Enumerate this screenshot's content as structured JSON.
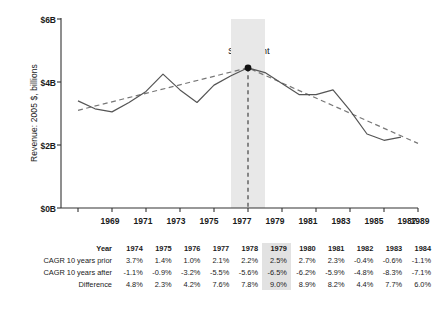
{
  "chart_data": {
    "type": "line",
    "title": "",
    "xlabel": "",
    "ylabel": "Revenue: 2005 $, billions",
    "xlim": [
      1968,
      1989
    ],
    "ylim": [
      0,
      6
    ],
    "xticks": [
      1969,
      1971,
      1973,
      1975,
      1977,
      1979,
      1981,
      1983,
      1985,
      1987,
      1989
    ],
    "xtick_labels": [
      "1969",
      "1971",
      "1973",
      "1975",
      "1977",
      "1979",
      "1981",
      "1983",
      "1985",
      "1987",
      "1989"
    ],
    "yticks": [
      0,
      2,
      4,
      6
    ],
    "ytick_labels": [
      "$0B",
      "$2B",
      "$4B",
      "$6B"
    ],
    "grid": false,
    "legend": null,
    "series": [
      {
        "name": "Revenue",
        "style": "solid",
        "color": "#555555",
        "x": [
          1969,
          1970,
          1971,
          1972,
          1973,
          1974,
          1975,
          1976,
          1977,
          1978,
          1979,
          1980,
          1981,
          1982,
          1983,
          1984,
          1985,
          1986,
          1987,
          1988
        ],
        "values": [
          3.4,
          3.15,
          3.05,
          3.35,
          3.7,
          4.25,
          3.75,
          3.35,
          3.9,
          4.2,
          4.45,
          4.3,
          3.95,
          3.6,
          3.6,
          3.75,
          3.1,
          2.35,
          2.15,
          2.25
        ]
      },
      {
        "name": "Trendline",
        "style": "dashed",
        "color": "#777777",
        "x": [
          1969,
          1979,
          1989
        ],
        "values": [
          3.1,
          4.45,
          2.05
        ]
      }
    ],
    "annotations": [
      {
        "label": "Stall point",
        "x": 1979,
        "y": 4.45,
        "marker": "filled-circle",
        "dropline": "dashed-vertical"
      }
    ],
    "highlight_band": {
      "x_start": 1978,
      "x_end": 1980,
      "color": "#e8e8e8"
    }
  },
  "table": {
    "row_headers": [
      "Year",
      "CAGR 10 years prior",
      "CAGR 10 years after",
      "Difference"
    ],
    "years": [
      "1974",
      "1975",
      "1976",
      "1977",
      "1978",
      "1979",
      "1980",
      "1981",
      "1982",
      "1983",
      "1984"
    ],
    "highlight_column_index": 5,
    "rows": [
      {
        "label": "CAGR 10 years prior",
        "values": [
          "3.7%",
          "1.4%",
          "1.0%",
          "2.1%",
          "2.2%",
          "2.5%",
          "2.7%",
          "2.3%",
          "-0.4%",
          "-0.6%",
          "-1.1%"
        ]
      },
      {
        "label": "CAGR 10 years after",
        "values": [
          "-1.1%",
          "-0.9%",
          "-3.2%",
          "-5.5%",
          "-5.6%",
          "-6.5%",
          "-6.2%",
          "-5.9%",
          "-4.8%",
          "-8.3%",
          "-7.1%"
        ]
      },
      {
        "label": "Difference",
        "values": [
          "4.8%",
          "2.3%",
          "4.2%",
          "7.6%",
          "7.8%",
          "9.0%",
          "8.9%",
          "8.2%",
          "4.4%",
          "7.7%",
          "6.0%"
        ]
      }
    ]
  },
  "colors": {
    "axis": "#333333",
    "line": "#555555",
    "trend": "#777777",
    "highlight": "#e8e8e8",
    "text": "#1a1a1a"
  }
}
